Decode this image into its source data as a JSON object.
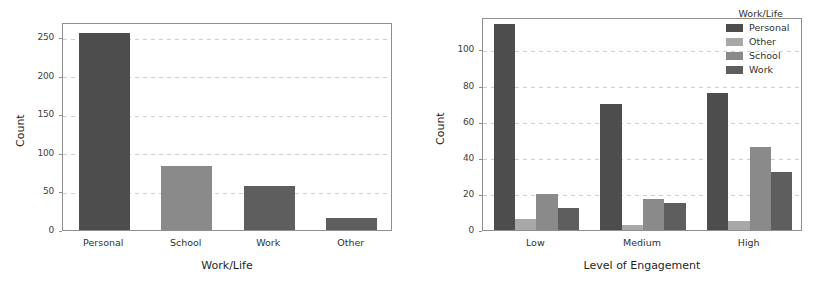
{
  "palette": {
    "personal": "#4d4d4d",
    "other": "#a8a8a8",
    "school": "#8a8a8a",
    "work": "#5e5e5e",
    "grid": "#cfcfcf",
    "axis": "#8f8f8f",
    "text": "#2b2b2b",
    "background": "#ffffff"
  },
  "chart_data": [
    {
      "id": "work-life-counts",
      "type": "bar",
      "title": "",
      "xlabel": "Work/Life",
      "ylabel": "Count",
      "categories": [
        "Personal",
        "School",
        "Work",
        "Other"
      ],
      "values": [
        256,
        83,
        57,
        15
      ],
      "bar_colors": [
        "#4d4d4d",
        "#8a8a8a",
        "#5e5e5e",
        "#5e5e5e"
      ],
      "ylim": [
        0,
        270
      ],
      "yticks": [
        0,
        50,
        100,
        150,
        200,
        250
      ],
      "ytick_labels": [
        "0",
        "50",
        "100",
        "150",
        "200",
        "250"
      ],
      "grid": true,
      "legend": false
    },
    {
      "id": "engagement-by-worklife",
      "type": "bar",
      "title": "",
      "xlabel": "Level of Engagement",
      "ylabel": "Count",
      "categories": [
        "Low",
        "Medium",
        "High"
      ],
      "series": [
        {
          "name": "Personal",
          "color": "#4d4d4d",
          "values": [
            114,
            70,
            76
          ]
        },
        {
          "name": "Other",
          "color": "#a8a8a8",
          "values": [
            6,
            3,
            5
          ]
        },
        {
          "name": "School",
          "color": "#8a8a8a",
          "values": [
            20,
            17,
            46
          ]
        },
        {
          "name": "Work",
          "color": "#5e5e5e",
          "values": [
            12,
            15,
            32
          ]
        }
      ],
      "ylim": [
        0,
        118
      ],
      "yticks": [
        0,
        20,
        40,
        60,
        80,
        100
      ],
      "ytick_labels": [
        "0",
        "20",
        "40",
        "60",
        "80",
        "100"
      ],
      "grid": true,
      "legend": true,
      "legend_title": "Work/Life",
      "legend_position": "upper right"
    }
  ]
}
